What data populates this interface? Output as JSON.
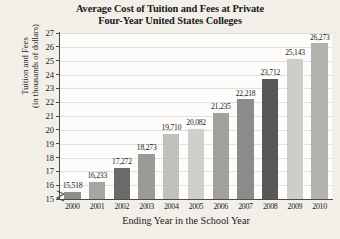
{
  "chart_data": {
    "type": "bar",
    "title": "Average Cost of Tuition and Fees at Private Four-Year United States Colleges",
    "title_lines": [
      "Average Cost of Tuition and Fees at Private",
      "Four-Year United States Colleges"
    ],
    "xlabel": "Ending Year in the School Year",
    "ylabel": "Tuition and Fees (in thousands of dollars)",
    "ylabel_lines": [
      "Tuition and Fees",
      "(in thousands of dollars)"
    ],
    "categories": [
      "2000",
      "2001",
      "2002",
      "2003",
      "2004",
      "2005",
      "2006",
      "2007",
      "2008",
      "2009",
      "2010"
    ],
    "values": [
      15518,
      16233,
      17272,
      18273,
      19710,
      20082,
      21235,
      22218,
      23712,
      25143,
      26273
    ],
    "data_labels": [
      "15,518",
      "16,233",
      "17,272",
      "18,273",
      "19,710",
      "20,082",
      "21,235",
      "22,218",
      "23,712",
      "25,143",
      "26,273"
    ],
    "bar_colors": [
      "#8d8d8b",
      "#a6a6a3",
      "#6b6b69",
      "#9a9a97",
      "#c0c0bd",
      "#cfcfcc",
      "#a0a09d",
      "#8b8b89",
      "#585856",
      "#cdcdc9",
      "#b2b2af"
    ],
    "y_ticks": [
      "15",
      "16",
      "17",
      "18",
      "19",
      "20",
      "21",
      "22",
      "23",
      "24",
      "25",
      "26",
      "27"
    ],
    "ylim": [
      15,
      27
    ],
    "y_unit": "thousands of dollars",
    "y_tick_step": 1,
    "grid": true,
    "grid_axis": "y",
    "legend": false,
    "axis_break": true,
    "axis_break_note": "zigzag break on vertical axis below 15",
    "background_color": "#f2efe9",
    "plot_background_color": "#fdfcfa",
    "axis_color": "#4a4a48",
    "gridline_color": "#e2e0dc"
  }
}
